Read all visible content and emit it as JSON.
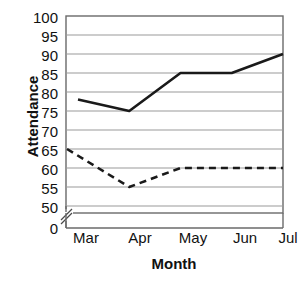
{
  "chart_data": {
    "type": "line",
    "title": "",
    "xlabel": "Month",
    "ylabel": "Attendance",
    "categories": [
      "Mar",
      "Apr",
      "May",
      "Jun",
      "Jul"
    ],
    "yticks": [
      100,
      95,
      90,
      85,
      80,
      75,
      70,
      65,
      60,
      55,
      50,
      0
    ],
    "ylim": [
      50,
      100
    ],
    "y_axis_break": true,
    "y_axis_break_note": "axis broken between 0 and 50",
    "grid": true,
    "legend": "none",
    "series": [
      {
        "name": "solid-series",
        "style": "solid",
        "color": "#1a1a1a",
        "values": [
          78,
          75,
          85,
          85,
          90
        ]
      },
      {
        "name": "dashed-series",
        "style": "dashed",
        "color": "#1a1a1a",
        "values": [
          65,
          55,
          60,
          60,
          60
        ]
      }
    ]
  },
  "axis": {
    "y_tick_labels": [
      "100",
      "95",
      "90",
      "85",
      "80",
      "75",
      "70",
      "65",
      "60",
      "55",
      "50",
      "0"
    ],
    "x_tick_labels": [
      "Mar",
      "Apr",
      "May",
      "Jun",
      "Jul"
    ],
    "y_title": "Attendance",
    "x_title": "Month"
  },
  "colors": {
    "line": "#1a1a1a",
    "grid": "#9a9a9a",
    "axis": "#4a4a4a",
    "background": "#ffffff",
    "text": "#111111"
  }
}
